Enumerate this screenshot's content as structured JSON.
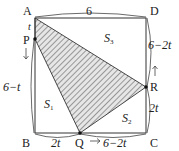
{
  "figure": {
    "type": "geometry-square-moving-points",
    "vertices": {
      "A": "A",
      "B": "B",
      "C": "C",
      "D": "D"
    },
    "moving_points": {
      "P": "P",
      "Q": "Q",
      "R": "R"
    },
    "regions": {
      "s1": {
        "base": "S",
        "sub": "1"
      },
      "s2": {
        "base": "S",
        "sub": "2"
      },
      "s3": {
        "base": "S",
        "sub": "3"
      }
    },
    "dimensions": {
      "top_AD": "6",
      "left_AP": "t",
      "left_PB": "6−t",
      "bottom_BQ": "2t",
      "bottom_QC": "6−2t",
      "right_CR": "2t",
      "right_RD": "6−2t"
    },
    "colors": {
      "stroke": "#333333",
      "hatch": "#555555",
      "hatch_bg": "#e6e6e6"
    }
  }
}
